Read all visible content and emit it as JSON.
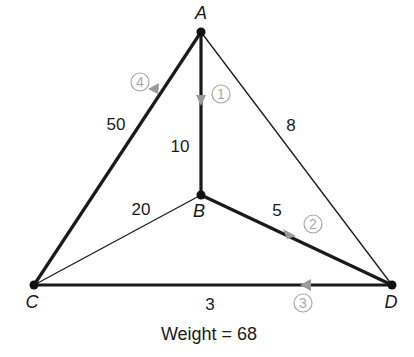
{
  "graph": {
    "nodes": [
      {
        "id": "A",
        "label": "A",
        "x": 201,
        "y": 32
      },
      {
        "id": "B",
        "label": "B",
        "x": 201,
        "y": 195
      },
      {
        "id": "C",
        "label": "C",
        "x": 34,
        "y": 285
      },
      {
        "id": "D",
        "label": "D",
        "x": 392,
        "y": 285
      }
    ],
    "edges": [
      {
        "from": "A",
        "to": "C",
        "weight": "50",
        "in_tour": true,
        "step": "4"
      },
      {
        "from": "A",
        "to": "B",
        "weight": "10",
        "in_tour": true,
        "step": "1"
      },
      {
        "from": "A",
        "to": "D",
        "weight": "8",
        "in_tour": false
      },
      {
        "from": "B",
        "to": "C",
        "weight": "20",
        "in_tour": false
      },
      {
        "from": "B",
        "to": "D",
        "weight": "5",
        "in_tour": true,
        "step": "2"
      },
      {
        "from": "C",
        "to": "D",
        "weight": "3",
        "in_tour": true,
        "step": "3"
      }
    ],
    "caption": "Weight = 68",
    "colors": {
      "edge": "#1a1a1a",
      "step_marker": "#a8a8a8",
      "background": "#ffffff"
    }
  }
}
